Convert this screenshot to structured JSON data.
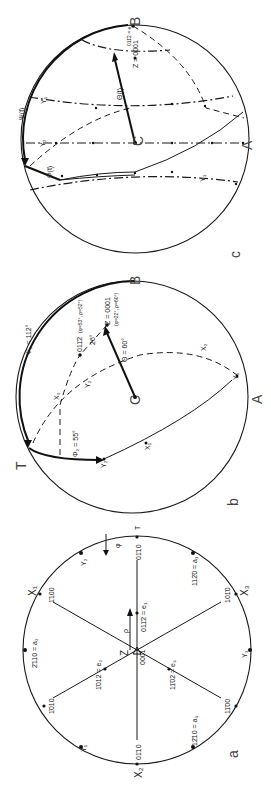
{
  "figure": {
    "orientation": "rotated-90-ccw",
    "panels": {
      "a": {
        "panel_label": "a",
        "labels": {
          "center": "0001",
          "z": "Z",
          "rho": "ρ",
          "phi": "φ",
          "t": "T",
          "p0110_top": "01̄10",
          "p0110_bottom": "01̄10",
          "p1100": "1̄100",
          "p1010_left": "1̄010",
          "p1010_right": "101̄0",
          "p1100_right": "11̄00",
          "a1": "112̄0 = a₁",
          "a2": "2̄110 = a₂",
          "a3": "12̄10 = a₃",
          "e1": "011̄2 = e₁",
          "e2": "1̄012 = e₂",
          "e3": "11̄02 = e₃",
          "x1": "X₁",
          "x2": "X₂",
          "x3": "X₃",
          "y1": "Y₁",
          "y2": "Y₂",
          "y3": "Y₃"
        }
      },
      "b": {
        "panel_label": "b",
        "labels": {
          "c": "C",
          "a": "A",
          "b": "B",
          "t": "T",
          "psi": "Ψ₂ = 112°",
          "phi": "Φ₂ = 55°",
          "theta": "Θ = 60°",
          "z": "Z = 0001",
          "z_coords": "(φ=22°, ρ=60°)",
          "pole": "011̄2",
          "pole_coords": "(φ=53°, ρ=52°)",
          "angle": "26°",
          "x1": "X₁",
          "x2": "X₂",
          "x3": "X₃",
          "y2": "Y₂",
          "y1": "Y₁"
        }
      },
      "c": {
        "panel_label": "c",
        "labels": {
          "c": "C",
          "a": "A",
          "b": "B",
          "psi": "Ψ(t)",
          "phi": "Φ(t)",
          "theta": "Θ(t)",
          "z": "Z = 0001",
          "pole": "011̄2 = e₁",
          "y1": "Y₁",
          "y2": "Y₂",
          "y3": "Y₃",
          "ticks": [
            "0",
            "2",
            "4",
            "6",
            "8",
            "10",
            "12"
          ]
        }
      }
    }
  }
}
